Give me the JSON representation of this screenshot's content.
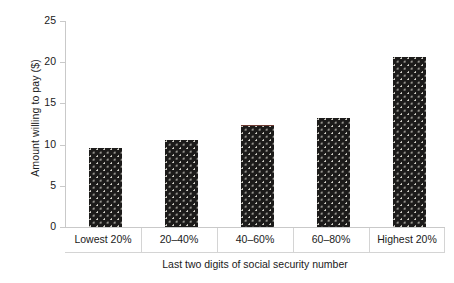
{
  "chart_data": {
    "type": "bar",
    "title": "",
    "subtitle": "",
    "xlabel": "Last two digits of social security number",
    "ylabel": "Amount willing to pay ($)",
    "categories": [
      "Lowest 20%",
      "20–40%",
      "40–60%",
      "60–80%",
      "Highest 20%"
    ],
    "values": [
      9.6,
      10.6,
      12.4,
      13.2,
      20.6
    ],
    "ylim": [
      0,
      25
    ],
    "ytick_labels": [
      "0",
      "5",
      "10",
      "15",
      "20",
      "25"
    ],
    "ytick_values": [
      0,
      5,
      10,
      15,
      20,
      25
    ],
    "grid": false,
    "legend": null,
    "annotations": [],
    "bar_color": "#1c1b1a",
    "bar_pattern": "light-dot-texture",
    "axis_color": "#c9c9c9"
  },
  "axes": {
    "y_label": "Amount willing to pay ($)",
    "x_label": "Last two digits of social security number"
  }
}
